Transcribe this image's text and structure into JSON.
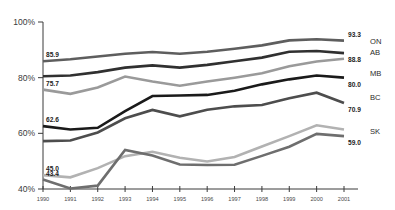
{
  "chart_data": {
    "type": "line",
    "title": "",
    "subtitle": "",
    "xlabel": "",
    "ylabel": "",
    "grid": false,
    "legend_position": "right-endpoint-labels",
    "x": [
      1990,
      1991,
      1992,
      1993,
      1994,
      1995,
      1996,
      1997,
      1998,
      1999,
      2000,
      2001
    ],
    "xtick_labels": [
      "1990",
      "1991",
      "1992",
      "1993",
      "1994",
      "1995",
      "1996",
      "1997",
      "1998",
      "1999",
      "2000",
      "2001"
    ],
    "ytick_labels": [
      "40%",
      "60%",
      "80%",
      "100%"
    ],
    "ytick_values": [
      40,
      60,
      80,
      100
    ],
    "ylim": [
      38,
      100
    ],
    "xlim": [
      1990,
      2001
    ],
    "series": [
      {
        "name": "ON",
        "color": "#5e5e5e",
        "start_label": "85.9",
        "end_label": "93.3",
        "values": [
          85.9,
          86.6,
          87.6,
          88.6,
          89.2,
          88.6,
          89.3,
          90.4,
          91.6,
          93.4,
          93.8,
          93.3
        ]
      },
      {
        "name": "AB",
        "color": "#303030",
        "start_label": "",
        "end_label": "88.8",
        "values": [
          80.5,
          80.8,
          82.0,
          83.6,
          84.4,
          83.6,
          84.6,
          85.9,
          87.2,
          89.3,
          89.6,
          88.8
        ]
      },
      {
        "name": "MB",
        "color": "#9a9a9a",
        "start_label": "75.7",
        "end_label": "",
        "values": [
          75.7,
          74.2,
          76.5,
          80.4,
          78.6,
          77.1,
          78.6,
          80.0,
          81.6,
          84.1,
          85.8,
          86.8
        ]
      },
      {
        "name": "BC",
        "color": "#1a1a1a",
        "start_label": "62.6",
        "end_label": "80.0",
        "values": [
          62.6,
          61.4,
          62.0,
          68.0,
          73.4,
          73.6,
          73.8,
          75.3,
          77.6,
          79.4,
          80.8,
          80.0
        ]
      },
      {
        "name": "SK",
        "color": "#4d4d4d",
        "start_label": "",
        "end_label": "70.9",
        "values": [
          57.2,
          57.4,
          60.3,
          65.4,
          68.4,
          66.1,
          68.5,
          69.7,
          70.2,
          72.6,
          74.6,
          70.9
        ]
      },
      {
        "name": "NB",
        "color": "#b2b2b2",
        "start_label": "45.0",
        "end_label": "",
        "values": [
          45.0,
          44.2,
          47.5,
          51.8,
          53.4,
          51.2,
          49.9,
          51.5,
          55.3,
          59.0,
          62.9,
          61.4
        ]
      },
      {
        "name": "NS",
        "color": "#6e6e6e",
        "start_label": "43.4",
        "end_label": "59.0",
        "values": [
          43.4,
          40.2,
          41.2,
          54.0,
          52.0,
          48.8,
          48.6,
          48.7,
          51.9,
          55.2,
          59.8,
          59.0
        ]
      }
    ],
    "endpoint_labels": [
      {
        "name": "ON",
        "value": "93.3"
      },
      {
        "name": "AB",
        "value": "88.8"
      },
      {
        "name": "MB",
        "value": "80.0"
      },
      {
        "name": "BC",
        "value": ""
      },
      {
        "name": "SK",
        "value": "70.9"
      },
      {
        "name": "",
        "value": "59.0"
      }
    ],
    "axis_color": "#3a3a3a"
  }
}
